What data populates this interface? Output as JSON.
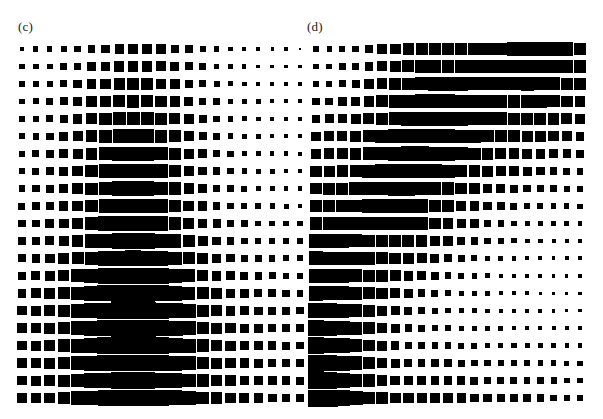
{
  "figure": {
    "type": "hinton-matrix-figure",
    "background_color": "#ffffff",
    "marker_color": "#000000",
    "width": 603,
    "height": 419
  },
  "panels": [
    {
      "id": "c",
      "label": "(c)",
      "origin_x": 22,
      "origin_y": 49,
      "step_x": 13.9,
      "step_y": 17.45,
      "max_size": 17.0
    },
    {
      "id": "d",
      "label": "(d)",
      "origin_x": 16,
      "origin_y": 49,
      "step_x": 13.2,
      "step_y": 17.45,
      "max_size": 17.0
    }
  ],
  "chart_data": [
    {
      "type": "heatmap",
      "title": "(c)",
      "xlabel": "",
      "ylabel": "",
      "grid": false,
      "legend": "none",
      "rows": 21,
      "cols": 21,
      "vmin": 0,
      "vmax": 1,
      "notes": "Hinton-style matrix: square area encodes magnitude; peak in lower-centre region near column 9, row 17.",
      "values": [
        [
          0.08,
          0.09,
          0.1,
          0.12,
          0.16,
          0.22,
          0.27,
          0.3,
          0.31,
          0.31,
          0.29,
          0.25,
          0.19,
          0.14,
          0.1,
          0.07,
          0.06,
          0.05,
          0.04,
          0.04,
          0.03
        ],
        [
          0.09,
          0.1,
          0.12,
          0.15,
          0.2,
          0.27,
          0.33,
          0.37,
          0.38,
          0.37,
          0.34,
          0.29,
          0.22,
          0.16,
          0.11,
          0.08,
          0.06,
          0.05,
          0.05,
          0.04,
          0.04
        ],
        [
          0.1,
          0.12,
          0.14,
          0.18,
          0.24,
          0.32,
          0.39,
          0.44,
          0.45,
          0.44,
          0.4,
          0.33,
          0.25,
          0.18,
          0.13,
          0.09,
          0.07,
          0.06,
          0.05,
          0.05,
          0.04
        ],
        [
          0.11,
          0.13,
          0.16,
          0.21,
          0.28,
          0.37,
          0.46,
          0.51,
          0.53,
          0.51,
          0.46,
          0.38,
          0.28,
          0.2,
          0.14,
          0.1,
          0.08,
          0.07,
          0.06,
          0.05,
          0.05
        ],
        [
          0.12,
          0.14,
          0.18,
          0.23,
          0.31,
          0.42,
          0.52,
          0.58,
          0.6,
          0.58,
          0.52,
          0.43,
          0.32,
          0.22,
          0.15,
          0.11,
          0.08,
          0.07,
          0.06,
          0.06,
          0.05
        ],
        [
          0.13,
          0.16,
          0.19,
          0.25,
          0.34,
          0.46,
          0.57,
          0.64,
          0.66,
          0.64,
          0.57,
          0.47,
          0.34,
          0.24,
          0.17,
          0.12,
          0.09,
          0.08,
          0.07,
          0.06,
          0.06
        ],
        [
          0.14,
          0.17,
          0.21,
          0.27,
          0.36,
          0.48,
          0.6,
          0.68,
          0.7,
          0.68,
          0.6,
          0.49,
          0.36,
          0.25,
          0.18,
          0.13,
          0.1,
          0.08,
          0.07,
          0.07,
          0.06
        ],
        [
          0.15,
          0.18,
          0.22,
          0.28,
          0.37,
          0.5,
          0.62,
          0.7,
          0.72,
          0.7,
          0.62,
          0.51,
          0.37,
          0.26,
          0.19,
          0.14,
          0.11,
          0.09,
          0.08,
          0.07,
          0.07
        ],
        [
          0.16,
          0.19,
          0.23,
          0.29,
          0.39,
          0.51,
          0.63,
          0.71,
          0.73,
          0.71,
          0.63,
          0.52,
          0.38,
          0.27,
          0.2,
          0.15,
          0.12,
          0.1,
          0.09,
          0.08,
          0.07
        ],
        [
          0.17,
          0.2,
          0.24,
          0.31,
          0.4,
          0.53,
          0.65,
          0.73,
          0.75,
          0.73,
          0.65,
          0.53,
          0.4,
          0.29,
          0.21,
          0.16,
          0.13,
          0.11,
          0.1,
          0.09,
          0.08
        ],
        [
          0.18,
          0.21,
          0.26,
          0.33,
          0.43,
          0.56,
          0.68,
          0.76,
          0.78,
          0.76,
          0.68,
          0.56,
          0.42,
          0.31,
          0.23,
          0.18,
          0.14,
          0.12,
          0.11,
          0.1,
          0.09
        ],
        [
          0.2,
          0.23,
          0.28,
          0.36,
          0.46,
          0.6,
          0.72,
          0.8,
          0.82,
          0.8,
          0.72,
          0.6,
          0.46,
          0.34,
          0.25,
          0.2,
          0.16,
          0.14,
          0.12,
          0.11,
          0.1
        ],
        [
          0.22,
          0.26,
          0.31,
          0.39,
          0.5,
          0.65,
          0.78,
          0.85,
          0.87,
          0.85,
          0.77,
          0.65,
          0.5,
          0.38,
          0.29,
          0.23,
          0.19,
          0.16,
          0.14,
          0.13,
          0.12
        ],
        [
          0.25,
          0.29,
          0.35,
          0.44,
          0.56,
          0.71,
          0.84,
          0.91,
          0.93,
          0.91,
          0.83,
          0.71,
          0.56,
          0.43,
          0.33,
          0.27,
          0.22,
          0.19,
          0.17,
          0.15,
          0.14
        ],
        [
          0.28,
          0.33,
          0.39,
          0.49,
          0.62,
          0.77,
          0.89,
          0.96,
          0.98,
          0.96,
          0.89,
          0.77,
          0.62,
          0.48,
          0.38,
          0.31,
          0.26,
          0.22,
          0.2,
          0.18,
          0.16
        ],
        [
          0.3,
          0.35,
          0.42,
          0.52,
          0.65,
          0.81,
          0.93,
          0.99,
          1.0,
          0.99,
          0.92,
          0.81,
          0.66,
          0.52,
          0.41,
          0.34,
          0.28,
          0.25,
          0.22,
          0.2,
          0.18
        ],
        [
          0.31,
          0.36,
          0.43,
          0.53,
          0.66,
          0.82,
          0.94,
          1.0,
          1.0,
          1.0,
          0.93,
          0.82,
          0.67,
          0.53,
          0.43,
          0.35,
          0.3,
          0.26,
          0.23,
          0.21,
          0.19
        ],
        [
          0.31,
          0.36,
          0.43,
          0.53,
          0.65,
          0.8,
          0.92,
          0.99,
          1.0,
          0.99,
          0.92,
          0.81,
          0.66,
          0.53,
          0.43,
          0.36,
          0.3,
          0.27,
          0.24,
          0.22,
          0.2
        ],
        [
          0.3,
          0.35,
          0.42,
          0.51,
          0.63,
          0.77,
          0.88,
          0.95,
          0.97,
          0.96,
          0.89,
          0.79,
          0.65,
          0.52,
          0.43,
          0.36,
          0.31,
          0.27,
          0.25,
          0.23,
          0.21
        ],
        [
          0.3,
          0.35,
          0.41,
          0.5,
          0.61,
          0.74,
          0.85,
          0.92,
          0.94,
          0.93,
          0.87,
          0.78,
          0.65,
          0.53,
          0.44,
          0.37,
          0.32,
          0.28,
          0.26,
          0.24,
          0.22
        ],
        [
          0.31,
          0.35,
          0.41,
          0.5,
          0.6,
          0.72,
          0.82,
          0.89,
          0.92,
          0.91,
          0.86,
          0.78,
          0.66,
          0.55,
          0.46,
          0.39,
          0.34,
          0.3,
          0.27,
          0.25,
          0.24
        ]
      ]
    },
    {
      "type": "heatmap",
      "title": "(d)",
      "xlabel": "",
      "ylabel": "",
      "grid": false,
      "legend": "none",
      "rows": 21,
      "cols": 21,
      "vmin": 0,
      "vmax": 1,
      "notes": "Hinton-style matrix: square area encodes magnitude; peak at bottom-left corner, decaying up and to the right.",
      "values": [
        [
          0.09,
          0.1,
          0.12,
          0.15,
          0.22,
          0.32,
          0.4,
          0.46,
          0.5,
          0.52,
          0.54,
          0.55,
          0.56,
          0.57,
          0.58,
          0.6,
          0.62,
          0.63,
          0.62,
          0.6,
          0.56
        ],
        [
          0.1,
          0.11,
          0.14,
          0.18,
          0.25,
          0.35,
          0.44,
          0.5,
          0.54,
          0.56,
          0.57,
          0.58,
          0.58,
          0.58,
          0.59,
          0.6,
          0.62,
          0.62,
          0.6,
          0.56,
          0.51
        ],
        [
          0.13,
          0.15,
          0.18,
          0.23,
          0.31,
          0.41,
          0.5,
          0.56,
          0.6,
          0.61,
          0.61,
          0.61,
          0.6,
          0.59,
          0.59,
          0.6,
          0.61,
          0.6,
          0.57,
          0.52,
          0.46
        ],
        [
          0.18,
          0.2,
          0.24,
          0.3,
          0.38,
          0.48,
          0.57,
          0.63,
          0.66,
          0.67,
          0.66,
          0.64,
          0.62,
          0.6,
          0.58,
          0.58,
          0.58,
          0.56,
          0.52,
          0.47,
          0.41
        ],
        [
          0.24,
          0.26,
          0.3,
          0.36,
          0.44,
          0.54,
          0.62,
          0.68,
          0.7,
          0.7,
          0.68,
          0.65,
          0.61,
          0.58,
          0.55,
          0.53,
          0.52,
          0.5,
          0.46,
          0.41,
          0.35
        ],
        [
          0.3,
          0.32,
          0.36,
          0.42,
          0.5,
          0.59,
          0.66,
          0.71,
          0.72,
          0.71,
          0.68,
          0.63,
          0.58,
          0.53,
          0.49,
          0.46,
          0.44,
          0.41,
          0.37,
          0.32,
          0.28
        ],
        [
          0.36,
          0.38,
          0.42,
          0.47,
          0.54,
          0.62,
          0.68,
          0.72,
          0.72,
          0.69,
          0.65,
          0.59,
          0.53,
          0.47,
          0.42,
          0.38,
          0.35,
          0.32,
          0.29,
          0.25,
          0.21
        ],
        [
          0.42,
          0.44,
          0.47,
          0.51,
          0.57,
          0.64,
          0.69,
          0.71,
          0.7,
          0.66,
          0.6,
          0.53,
          0.46,
          0.4,
          0.34,
          0.3,
          0.27,
          0.24,
          0.21,
          0.18,
          0.16
        ],
        [
          0.48,
          0.49,
          0.51,
          0.55,
          0.59,
          0.64,
          0.68,
          0.69,
          0.66,
          0.61,
          0.54,
          0.46,
          0.39,
          0.32,
          0.27,
          0.23,
          0.2,
          0.17,
          0.15,
          0.13,
          0.12
        ],
        [
          0.53,
          0.54,
          0.55,
          0.57,
          0.6,
          0.63,
          0.65,
          0.64,
          0.6,
          0.54,
          0.46,
          0.38,
          0.31,
          0.25,
          0.2,
          0.17,
          0.14,
          0.12,
          0.11,
          0.1,
          0.09
        ],
        [
          0.58,
          0.58,
          0.58,
          0.58,
          0.59,
          0.6,
          0.6,
          0.58,
          0.53,
          0.46,
          0.38,
          0.3,
          0.24,
          0.19,
          0.15,
          0.12,
          0.1,
          0.09,
          0.08,
          0.08,
          0.07
        ],
        [
          0.62,
          0.61,
          0.6,
          0.59,
          0.57,
          0.56,
          0.54,
          0.5,
          0.44,
          0.37,
          0.29,
          0.23,
          0.18,
          0.14,
          0.11,
          0.09,
          0.08,
          0.07,
          0.06,
          0.06,
          0.06
        ],
        [
          0.66,
          0.64,
          0.61,
          0.58,
          0.55,
          0.51,
          0.47,
          0.42,
          0.35,
          0.28,
          0.22,
          0.17,
          0.13,
          0.1,
          0.08,
          0.07,
          0.06,
          0.05,
          0.05,
          0.05,
          0.05
        ],
        [
          0.7,
          0.67,
          0.63,
          0.58,
          0.52,
          0.46,
          0.4,
          0.33,
          0.27,
          0.21,
          0.16,
          0.12,
          0.1,
          0.08,
          0.07,
          0.06,
          0.05,
          0.05,
          0.04,
          0.04,
          0.04
        ],
        [
          0.75,
          0.71,
          0.65,
          0.58,
          0.5,
          0.42,
          0.34,
          0.27,
          0.21,
          0.16,
          0.12,
          0.1,
          0.08,
          0.07,
          0.06,
          0.05,
          0.05,
          0.04,
          0.04,
          0.04,
          0.04
        ],
        [
          0.8,
          0.75,
          0.68,
          0.58,
          0.48,
          0.38,
          0.29,
          0.22,
          0.17,
          0.13,
          0.1,
          0.09,
          0.08,
          0.07,
          0.06,
          0.06,
          0.05,
          0.05,
          0.05,
          0.04,
          0.04
        ],
        [
          0.86,
          0.8,
          0.71,
          0.59,
          0.47,
          0.35,
          0.26,
          0.2,
          0.16,
          0.13,
          0.11,
          0.1,
          0.09,
          0.08,
          0.08,
          0.07,
          0.07,
          0.06,
          0.06,
          0.06,
          0.05
        ],
        [
          0.92,
          0.85,
          0.74,
          0.6,
          0.46,
          0.34,
          0.25,
          0.2,
          0.17,
          0.15,
          0.14,
          0.13,
          0.12,
          0.11,
          0.1,
          0.1,
          0.09,
          0.08,
          0.08,
          0.07,
          0.07
        ],
        [
          0.98,
          0.9,
          0.78,
          0.62,
          0.47,
          0.35,
          0.27,
          0.23,
          0.21,
          0.19,
          0.18,
          0.17,
          0.16,
          0.15,
          0.14,
          0.13,
          0.12,
          0.11,
          0.1,
          0.09,
          0.09
        ],
        [
          1.0,
          0.95,
          0.83,
          0.66,
          0.51,
          0.4,
          0.33,
          0.29,
          0.27,
          0.25,
          0.24,
          0.23,
          0.22,
          0.2,
          0.18,
          0.17,
          0.15,
          0.14,
          0.13,
          0.12,
          0.11
        ],
        [
          1.0,
          1.0,
          0.88,
          0.72,
          0.58,
          0.48,
          0.41,
          0.37,
          0.34,
          0.32,
          0.3,
          0.29,
          0.27,
          0.25,
          0.23,
          0.21,
          0.19,
          0.18,
          0.16,
          0.15,
          0.14
        ]
      ]
    }
  ]
}
